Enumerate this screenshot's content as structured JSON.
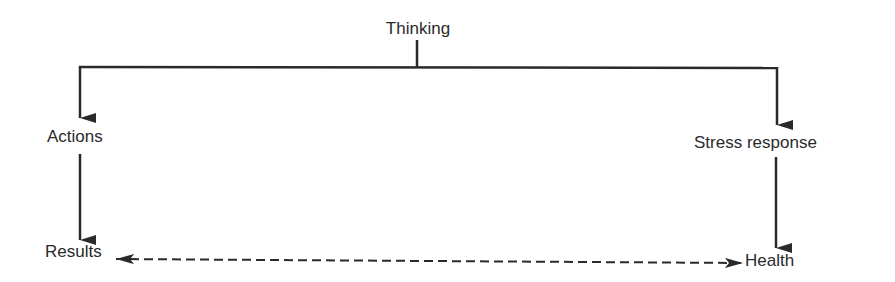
{
  "diagram": {
    "type": "flow",
    "nodes": {
      "thinking": {
        "label": "Thinking"
      },
      "actions": {
        "label": "Actions"
      },
      "stress_response": {
        "label": "Stress response"
      },
      "results": {
        "label": "Results"
      },
      "health": {
        "label": "Health"
      }
    },
    "edges": [
      {
        "from": "Thinking",
        "to": "Actions",
        "style": "solid",
        "direction": "forward"
      },
      {
        "from": "Thinking",
        "to": "Stress response",
        "style": "solid",
        "direction": "forward"
      },
      {
        "from": "Actions",
        "to": "Results",
        "style": "solid",
        "direction": "forward"
      },
      {
        "from": "Stress response",
        "to": "Health",
        "style": "solid",
        "direction": "forward"
      },
      {
        "from": "Results",
        "to": "Health",
        "style": "dashed",
        "direction": "bidirectional"
      }
    ],
    "colors": {
      "line": "#2a2a2a",
      "text": "#2a2a2a",
      "background": "#ffffff"
    }
  }
}
